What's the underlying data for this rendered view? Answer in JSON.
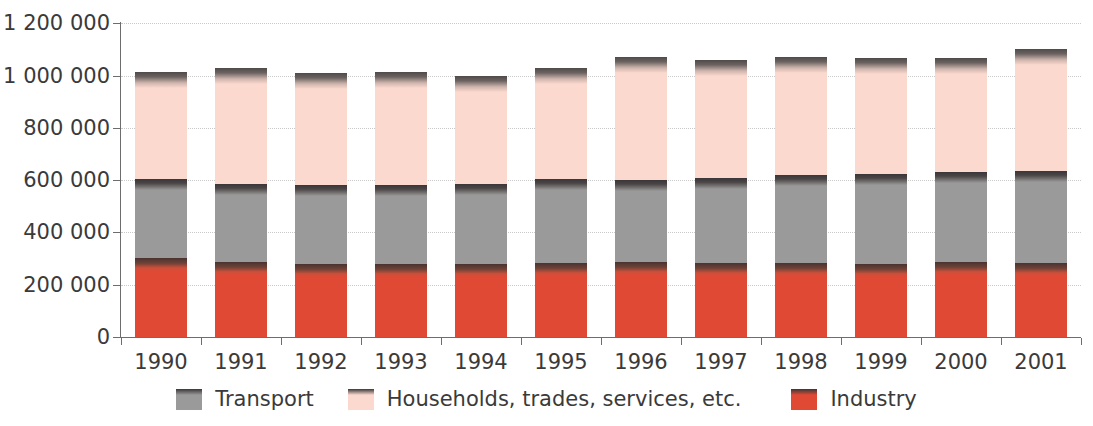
{
  "chart_data": {
    "type": "bar",
    "stacked": true,
    "title": "",
    "subtitle": "",
    "xlabel": "",
    "ylabel": "",
    "categories": [
      "1990",
      "1991",
      "1992",
      "1993",
      "1994",
      "1995",
      "1996",
      "1997",
      "1998",
      "1999",
      "2000",
      "2001"
    ],
    "series": [
      {
        "name": "Industry",
        "color": "#e04a35",
        "values": [
          302000,
          287000,
          280000,
          279000,
          279000,
          283000,
          287000,
          285000,
          283000,
          280000,
          287000,
          284000
        ]
      },
      {
        "name": "Transport",
        "color": "#9a9a9a",
        "values": [
          303000,
          300000,
          303000,
          304000,
          306000,
          321000,
          313000,
          324000,
          336000,
          344000,
          344000,
          352000
        ]
      },
      {
        "name": "Households, trades, services, etc.",
        "color": "#fbd9ce",
        "values": [
          410000,
          443000,
          427000,
          432000,
          415000,
          424000,
          470000,
          451000,
          451000,
          444000,
          435000,
          464000
        ]
      }
    ],
    "totals": [
      1015000,
      1030000,
      1010000,
      1015000,
      1000000,
      1028000,
      1070000,
      1060000,
      1070000,
      1068000,
      1066000,
      1100000
    ],
    "ylim": [
      0,
      1200000
    ],
    "y_ticks": [
      0,
      200000,
      400000,
      600000,
      800000,
      1000000,
      1200000
    ],
    "y_tick_labels": [
      "0",
      "200 000",
      "400 000",
      "600 000",
      "800 000",
      "1 000 000",
      "1 200 000"
    ],
    "grid": true,
    "grid_axis": "y",
    "legend_position": "bottom",
    "legend_order": [
      "Transport",
      "Households, trades, services, etc.",
      "Industry"
    ]
  },
  "legend": {
    "items": [
      {
        "label": "Transport",
        "color": "#9a9a9a",
        "key": "transport"
      },
      {
        "label": "Households, trades, services, etc.",
        "color": "#fbd9ce",
        "key": "households"
      },
      {
        "label": "Industry",
        "color": "#e04a35",
        "key": "industry"
      }
    ]
  },
  "axis": {
    "value_max": 1200000,
    "value_min": 0
  }
}
